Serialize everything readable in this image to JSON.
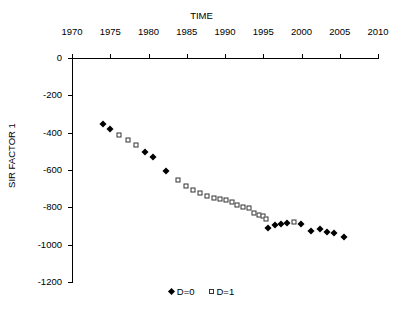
{
  "chart_data": {
    "type": "scatter",
    "title": "",
    "xlabel": "TIME",
    "ylabel": "SIR FACTOR 1",
    "xlim": [
      1970,
      2010
    ],
    "ylim": [
      -1200,
      0
    ],
    "xticks": [
      1970,
      1975,
      1980,
      1985,
      1990,
      1995,
      2000,
      2005,
      2010
    ],
    "yticks": [
      0,
      -200,
      -400,
      -600,
      -800,
      -1000,
      -1200
    ],
    "xtick_labels": [
      "1970",
      "1975",
      "1980",
      "1985",
      "1990",
      "1995",
      "2000",
      "2005",
      "2010"
    ],
    "ytick_labels": [
      "0",
      "-200",
      "-400",
      "-600",
      "-800",
      "-1000",
      "-1200"
    ],
    "grid": false,
    "legend_position": "bottom-center",
    "xaxis_position": "top",
    "series": [
      {
        "name": "D=0",
        "marker": "filled-diamond",
        "color": "#000000",
        "points": [
          {
            "x": 1974.0,
            "y": -355
          },
          {
            "x": 1975.0,
            "y": -380
          },
          {
            "x": 1979.6,
            "y": -505
          },
          {
            "x": 1980.6,
            "y": -530
          },
          {
            "x": 1982.3,
            "y": -605
          },
          {
            "x": 1995.6,
            "y": -910
          },
          {
            "x": 1996.5,
            "y": -895
          },
          {
            "x": 1997.3,
            "y": -890
          },
          {
            "x": 1998.1,
            "y": -885
          },
          {
            "x": 1999.9,
            "y": -888
          },
          {
            "x": 2001.2,
            "y": -925
          },
          {
            "x": 2002.4,
            "y": -915
          },
          {
            "x": 2003.3,
            "y": -930
          },
          {
            "x": 2004.2,
            "y": -935
          },
          {
            "x": 2005.5,
            "y": -958
          }
        ]
      },
      {
        "name": "D=1",
        "marker": "open-square",
        "color": "#333333",
        "points": [
          {
            "x": 1976.2,
            "y": -410
          },
          {
            "x": 1977.3,
            "y": -440
          },
          {
            "x": 1978.4,
            "y": -465
          },
          {
            "x": 1983.9,
            "y": -655
          },
          {
            "x": 1984.9,
            "y": -685
          },
          {
            "x": 1985.8,
            "y": -705
          },
          {
            "x": 1986.7,
            "y": -725
          },
          {
            "x": 1987.6,
            "y": -740
          },
          {
            "x": 1988.5,
            "y": -748
          },
          {
            "x": 1989.3,
            "y": -755
          },
          {
            "x": 1990.1,
            "y": -762
          },
          {
            "x": 1990.9,
            "y": -772
          },
          {
            "x": 1991.6,
            "y": -790
          },
          {
            "x": 1992.4,
            "y": -800
          },
          {
            "x": 1993.1,
            "y": -805
          },
          {
            "x": 1993.8,
            "y": -828
          },
          {
            "x": 1994.4,
            "y": -840
          },
          {
            "x": 1995.0,
            "y": -848
          },
          {
            "x": 1995.3,
            "y": -862
          },
          {
            "x": 1999.0,
            "y": -880
          }
        ]
      }
    ]
  },
  "legend": {
    "items": [
      {
        "label": "D=0",
        "marker": "filled-diamond"
      },
      {
        "label": "D=1",
        "marker": "open-square"
      }
    ]
  }
}
